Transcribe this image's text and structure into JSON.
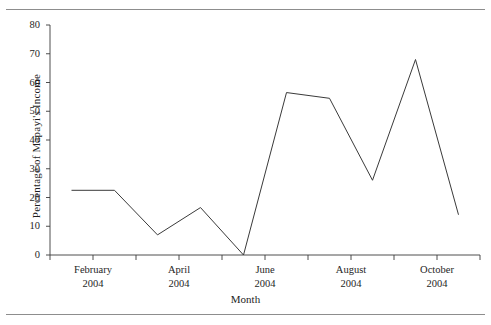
{
  "figure": {
    "background": "#ffffff",
    "ink_color": "#3a3a3a",
    "rule_color": "#8d8d8d"
  },
  "chart_data": {
    "type": "line",
    "title": "",
    "xlabel": "Month",
    "ylabel": "Percentage of  Mapayi's Income",
    "ylim": [
      0,
      80
    ],
    "yticks": [
      0,
      10,
      20,
      30,
      40,
      50,
      60,
      70,
      80
    ],
    "ytick_labels": [
      "0",
      "10",
      "20",
      "30",
      "40",
      "50",
      "60",
      "70",
      "80"
    ],
    "grid": false,
    "legend": null,
    "xtick_labels": [
      {
        "month": "February",
        "year": "2004"
      },
      {
        "month": "April",
        "year": "2004"
      },
      {
        "month": "June",
        "year": "2004"
      },
      {
        "month": "August",
        "year": "2004"
      },
      {
        "month": "October",
        "year": "2004"
      }
    ],
    "x_index": [
      0,
      1,
      2,
      3,
      4,
      5,
      6,
      7,
      8,
      9
    ],
    "categories": [
      "February 2004",
      "March 2004",
      "April 2004",
      "May 2004",
      "June 2004",
      "July 2004",
      "August 2004",
      "September 2004",
      "October 2004",
      "November 2004"
    ],
    "values": [
      22.5,
      22.5,
      7,
      16.5,
      0,
      56.5,
      54.5,
      26,
      68,
      14
    ],
    "series": [
      {
        "name": "Percentage of Mapayi's Income",
        "values": [
          22.5,
          22.5,
          7,
          16.5,
          0,
          56.5,
          54.5,
          26,
          68,
          14
        ]
      }
    ]
  },
  "axis_titles": {
    "y": "Percentage of  Mapayi's Income",
    "x": "Month"
  }
}
